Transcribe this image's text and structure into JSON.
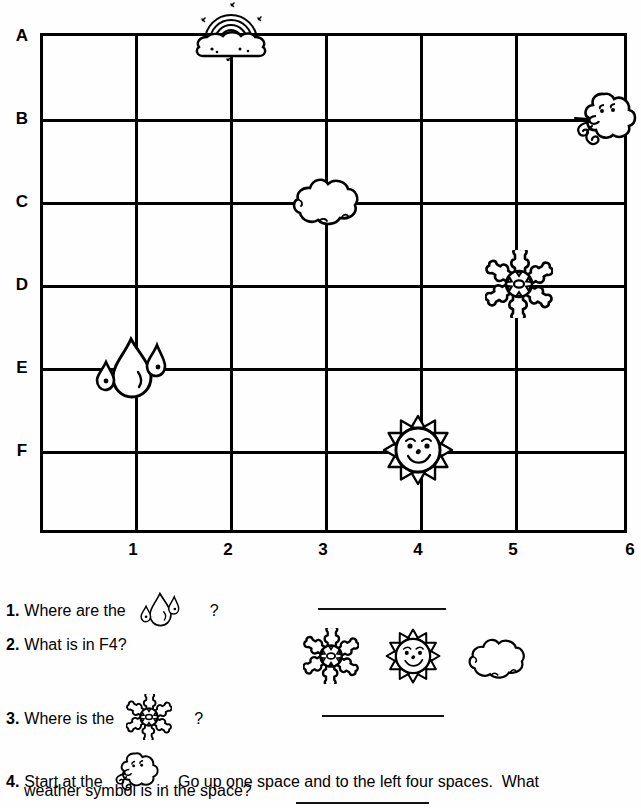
{
  "worksheet": {
    "grid": {
      "row_labels": [
        "A",
        "B",
        "C",
        "D",
        "E",
        "F"
      ],
      "col_labels": [
        "1",
        "2",
        "3",
        "4",
        "5",
        "6"
      ],
      "placements": [
        {
          "icon": "rainbow-cloud-icon",
          "col": "2",
          "row": "A"
        },
        {
          "icon": "wind-cloud-icon",
          "col": "6",
          "row": "B"
        },
        {
          "icon": "cloud-icon",
          "col": "3",
          "row": "C"
        },
        {
          "icon": "snowflake-icon",
          "col": "5",
          "row": "D"
        },
        {
          "icon": "raindrops-icon",
          "col": "1",
          "row": "E"
        },
        {
          "icon": "sun-icon",
          "col": "4",
          "row": "F"
        }
      ]
    },
    "questions": [
      {
        "number": "1.",
        "text_before": "Where are the",
        "icon": "raindrops-icon",
        "text_after": "?"
      },
      {
        "number": "2.",
        "text_before": "What is in F4?",
        "icon": "",
        "text_after": ""
      },
      {
        "number": "3.",
        "text_before": "Where is the",
        "icon": "snowflake-icon",
        "text_after": "?"
      },
      {
        "number": "4.",
        "text_before": "Start at the",
        "icon": "wind-cloud-icon",
        "text_after": ".  Go up one space and to the left four spaces.  What",
        "line2": "weather symbol is in the space?"
      }
    ],
    "answer_choices": [
      "snowflake-icon",
      "sun-icon",
      "cloud-icon"
    ]
  }
}
